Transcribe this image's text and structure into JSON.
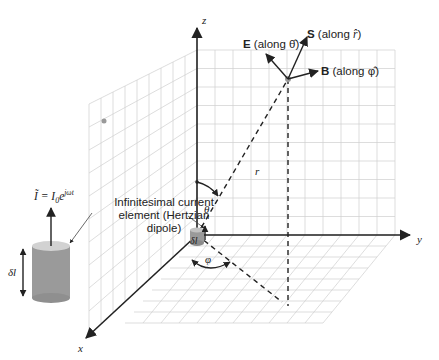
{
  "diagram": {
    "axes": {
      "x": "x",
      "y": "y",
      "z": "z"
    },
    "vectors": {
      "S": {
        "bold": "S",
        "rest": " (along ",
        "unit": "r̂",
        "close": ")"
      },
      "E": {
        "bold": "E",
        "rest": " (along ",
        "unit": "θ̂",
        "close": ")"
      },
      "B": {
        "bold": "B",
        "rest": " (along ",
        "unit": "φ̂",
        "close": ")"
      }
    },
    "labels": {
      "r": "r",
      "theta": "θ",
      "phi": "φ",
      "delta_l_small": "δl",
      "delta_l_large": "δl",
      "current_line1": "Infinitesimal current",
      "current_line2": "element (Hertzian",
      "current_line3": "dipole)",
      "current_eq_lhs": "Ĩ = I",
      "current_eq_sub": "0",
      "current_eq_e": "e",
      "current_eq_sup": "jωt"
    },
    "colors": {
      "axis": "#222222",
      "grid": "#cfcfcf",
      "cylinder_body": "#9a9a9a",
      "cylinder_top": "#cfcfcf",
      "point": "#999999"
    }
  }
}
